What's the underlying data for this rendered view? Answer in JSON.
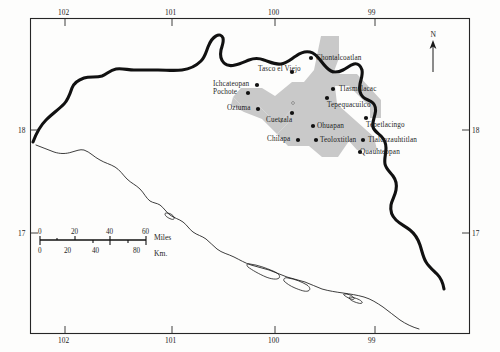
{
  "map": {
    "title": "Map of the Guerrero region, Mexico",
    "frame": {
      "x": 30,
      "y": 18,
      "width": 440,
      "height": 316
    },
    "colors": {
      "background": "#fdfdfc",
      "frame_stroke": "#262626",
      "state_border": "#111111",
      "coastline": "#1b1b1b",
      "shaded_band": "#c9c9c9",
      "town_dot": "#111111",
      "text": "#1d1d1d"
    },
    "axes": {
      "longitude_top": [
        {
          "label": "102",
          "x": 65
        },
        {
          "label": "101",
          "x": 172
        },
        {
          "label": "100",
          "x": 275
        },
        {
          "label": "99",
          "x": 375
        }
      ],
      "longitude_bottom": [
        {
          "label": "102",
          "x": 65
        },
        {
          "label": "101",
          "x": 172
        },
        {
          "label": "100",
          "x": 275
        },
        {
          "label": "99",
          "x": 375
        }
      ],
      "latitude_left": [
        {
          "label": "18",
          "y": 130
        },
        {
          "label": "17",
          "y": 233
        }
      ],
      "latitude_right": [
        {
          "label": "18",
          "y": 130
        },
        {
          "label": "17",
          "y": 233
        }
      ]
    },
    "north_arrow": {
      "label": "N",
      "x": 433,
      "y": 32
    },
    "scalebar": {
      "miles": {
        "unit": "Miles",
        "ticks": [
          "0",
          "20",
          "40",
          "60"
        ]
      },
      "kilometers": {
        "unit": "Km.",
        "ticks": [
          "0",
          "20",
          "40",
          "80"
        ]
      }
    },
    "towns": [
      {
        "name": "Chontalcoatlan",
        "dot_x": 311,
        "dot_y": 58,
        "label_x": 316,
        "label_y": 55,
        "anchor": "left"
      },
      {
        "name": "Tasco el Viejo",
        "dot_x": 292,
        "dot_y": 72,
        "label_x": 258,
        "label_y": 66,
        "anchor": "left"
      },
      {
        "name": "Ichcateopan",
        "dot_x": 257,
        "dot_y": 85,
        "label_x": 213,
        "label_y": 81,
        "anchor": "left"
      },
      {
        "name": "Pochote",
        "dot_x": 248,
        "dot_y": 93,
        "label_x": 213,
        "label_y": 89,
        "anchor": "left"
      },
      {
        "name": "Tlasmalacac",
        "dot_x": 333,
        "dot_y": 89,
        "label_x": 339,
        "label_y": 86,
        "anchor": "left"
      },
      {
        "name": "Tepequacuilco",
        "dot_x": 327,
        "dot_y": 98,
        "label_x": 327,
        "label_y": 102,
        "anchor": "left"
      },
      {
        "name": "Oztuma",
        "dot_x": 258,
        "dot_y": 109,
        "label_x": 227,
        "label_y": 105,
        "anchor": "left"
      },
      {
        "name": "Cuetzala",
        "dot_x": 292,
        "dot_y": 113,
        "label_x": 266,
        "label_y": 117,
        "anchor": "left"
      },
      {
        "name": "Tepetlacingo",
        "dot_x": 366,
        "dot_y": 118,
        "label_x": 366,
        "label_y": 122,
        "anchor": "left"
      },
      {
        "name": "Ohuapan",
        "dot_x": 313,
        "dot_y": 126,
        "label_x": 317,
        "label_y": 123,
        "anchor": "left"
      },
      {
        "name": "Chilapa",
        "dot_x": 298,
        "dot_y": 140,
        "label_x": 267,
        "label_y": 136,
        "anchor": "left"
      },
      {
        "name": "Teoloxtitlan",
        "dot_x": 316,
        "dot_y": 140,
        "label_x": 320,
        "label_y": 137,
        "anchor": "left"
      },
      {
        "name": "Tlalcozauhtitlan",
        "dot_x": 363,
        "dot_y": 140,
        "label_x": 368,
        "label_y": 137,
        "anchor": "left"
      },
      {
        "name": "Quauhteopan",
        "dot_x": 360,
        "dot_y": 152,
        "label_x": 360,
        "label_y": 149,
        "anchor": "left"
      }
    ],
    "minor_markers": [
      {
        "x": 293,
        "y": 103
      },
      {
        "x": 281,
        "y": 121
      }
    ]
  }
}
